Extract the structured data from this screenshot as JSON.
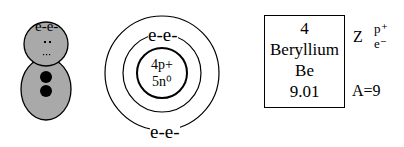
{
  "lewis": {
    "electrons_label": "e-e-",
    "head_color": "#a9a9a9",
    "body_color": "#a9a9a9"
  },
  "bohr": {
    "nucleus_line1": "4p+",
    "nucleus_line2": "5n⁰",
    "shell_top_label": "e-e-",
    "shell_bottom_label": "e-e-"
  },
  "element_card": {
    "atomic_number": "4",
    "name": "Beryllium",
    "symbol": "Be",
    "atomic_mass": "9.01"
  },
  "legend": {
    "z_label": "Z",
    "p_label": "p⁺",
    "e_label": "e⁻",
    "a_label": "A=9"
  }
}
